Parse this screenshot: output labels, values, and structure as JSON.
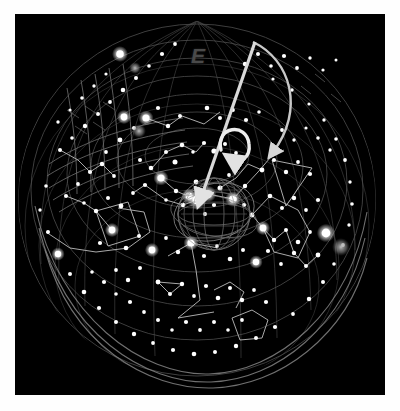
{
  "view": {
    "title": "All-sky star chart",
    "background_color": "#000000",
    "plate_border_color": "#ffffff",
    "star_color": "#ffffff",
    "constellation_line_color": "#b9b9b9",
    "grid_line_color": "#6a6a6a",
    "annotation_color": "#e8e8e8",
    "width": 400,
    "height": 411
  },
  "compass": {
    "markers": [
      {
        "label": "E",
        "x": 191,
        "y": 45,
        "color": "#4a4a4a"
      }
    ]
  },
  "annotations": {
    "pointer_arrow": {
      "name": "zenith-pointer-arrow",
      "label": "",
      "from_x": 255,
      "from_y": 45,
      "to_x": 182,
      "to_y": 187,
      "color": "#d8d8d8",
      "width": 3.2
    },
    "curved_arrow_large": {
      "name": "rotation-arrow-large",
      "label": "",
      "color": "#cfcfcf",
      "width": 2.6
    },
    "curved_arrow_small": {
      "name": "rotation-arrow-small",
      "label": "",
      "color": "#eaeaea",
      "width": 3.4
    }
  },
  "objects": {
    "center_globe": {
      "name": "wireframe-globe",
      "cx": 199,
      "cy": 200,
      "r": 36,
      "color": "#8a8a8a",
      "label": ""
    },
    "nebula_right": {
      "name": "fuzzy-object",
      "cx": 326,
      "cy": 233,
      "r": 8,
      "color": "#9a9a9a"
    },
    "nebula_upper_left": {
      "name": "fuzzy-object",
      "cx": 120,
      "cy": 54,
      "r": 5,
      "color": "#8d8d8d"
    },
    "nebula_mid_left": {
      "name": "fuzzy-object",
      "cx": 124,
      "cy": 117,
      "r": 6,
      "color": "#757575"
    }
  },
  "chart_data": {
    "type": "scatter",
    "xlabel": "",
    "ylabel": "",
    "grid": true,
    "legend_position": "none",
    "horizon_circle": {
      "cx": 197,
      "cy": 200,
      "r": 178
    },
    "altitude_circles": [
      178,
      150,
      118,
      84,
      50
    ],
    "stars": [
      [
        197,
        200,
        3.4
      ],
      [
        189,
        196,
        2.6
      ],
      [
        208,
        194,
        2.9
      ],
      [
        183,
        205,
        2.3
      ],
      [
        214,
        205,
        2.1
      ],
      [
        196,
        182,
        2.4
      ],
      [
        205,
        214,
        2.0
      ],
      [
        176,
        191,
        2.2
      ],
      [
        220,
        188,
        2.5
      ],
      [
        166,
        200,
        1.8
      ],
      [
        233,
        199,
        3.0
      ],
      [
        245,
        186,
        2.2
      ],
      [
        229,
        175,
        1.9
      ],
      [
        244,
        205,
        2.1
      ],
      [
        252,
        215,
        2.4
      ],
      [
        161,
        178,
        2.8
      ],
      [
        151,
        168,
        2.3
      ],
      [
        140,
        160,
        2.0
      ],
      [
        145,
        185,
        2.1
      ],
      [
        133,
        193,
        1.9
      ],
      [
        175,
        162,
        2.5
      ],
      [
        166,
        152,
        2.0
      ],
      [
        182,
        145,
        2.3
      ],
      [
        193,
        152,
        1.8
      ],
      [
        204,
        143,
        2.1
      ],
      [
        214,
        151,
        2.6
      ],
      [
        225,
        144,
        2.0
      ],
      [
        236,
        153,
        1.9
      ],
      [
        121,
        206,
        2.4
      ],
      [
        108,
        198,
        2.0
      ],
      [
        96,
        211,
        2.2
      ],
      [
        84,
        203,
        1.8
      ],
      [
        112,
        230,
        2.5
      ],
      [
        100,
        243,
        2.1
      ],
      [
        126,
        248,
        2.3
      ],
      [
        139,
        236,
        2.0
      ],
      [
        152,
        250,
        2.6
      ],
      [
        166,
        238,
        1.9
      ],
      [
        178,
        252,
        2.2
      ],
      [
        191,
        243,
        2.8
      ],
      [
        204,
        256,
        2.1
      ],
      [
        217,
        246,
        1.9
      ],
      [
        230,
        259,
        2.3
      ],
      [
        243,
        250,
        2.0
      ],
      [
        256,
        262,
        2.5
      ],
      [
        268,
        251,
        2.1
      ],
      [
        281,
        264,
        1.9
      ],
      [
        294,
        253,
        2.2
      ],
      [
        306,
        266,
        2.0
      ],
      [
        318,
        255,
        2.4
      ],
      [
        60,
        150,
        2.0
      ],
      [
        72,
        138,
        1.8
      ],
      [
        85,
        126,
        2.2
      ],
      [
        98,
        114,
        2.0
      ],
      [
        110,
        102,
        1.9
      ],
      [
        123,
        90,
        2.3
      ],
      [
        136,
        78,
        2.0
      ],
      [
        149,
        66,
        1.8
      ],
      [
        162,
        54,
        2.1
      ],
      [
        175,
        44,
        1.9
      ],
      [
        245,
        64,
        2.2
      ],
      [
        258,
        54,
        2.0
      ],
      [
        271,
        66,
        1.8
      ],
      [
        284,
        56,
        2.1
      ],
      [
        297,
        68,
        1.9
      ],
      [
        310,
        58,
        1.7
      ],
      [
        323,
        70,
        1.6
      ],
      [
        336,
        60,
        1.5
      ],
      [
        46,
        186,
        1.8
      ],
      [
        40,
        210,
        1.7
      ],
      [
        48,
        232,
        2.0
      ],
      [
        58,
        254,
        2.2
      ],
      [
        70,
        274,
        2.0
      ],
      [
        84,
        292,
        2.3
      ],
      [
        99,
        308,
        2.1
      ],
      [
        116,
        322,
        2.0
      ],
      [
        134,
        334,
        2.2
      ],
      [
        153,
        343,
        1.9
      ],
      [
        173,
        350,
        2.1
      ],
      [
        194,
        354,
        2.3
      ],
      [
        215,
        352,
        2.0
      ],
      [
        236,
        346,
        2.2
      ],
      [
        256,
        338,
        2.0
      ],
      [
        275,
        327,
        2.1
      ],
      [
        293,
        314,
        1.9
      ],
      [
        309,
        299,
        2.2
      ],
      [
        323,
        282,
        2.0
      ],
      [
        334,
        264,
        1.8
      ],
      [
        343,
        245,
        1.9
      ],
      [
        349,
        225,
        1.7
      ],
      [
        352,
        204,
        1.8
      ],
      [
        350,
        182,
        1.7
      ],
      [
        345,
        160,
        1.9
      ],
      [
        336,
        139,
        1.8
      ],
      [
        324,
        120,
        1.7
      ],
      [
        309,
        104,
        1.6
      ],
      [
        292,
        90,
        1.7
      ],
      [
        273,
        79,
        1.6
      ],
      [
        146,
        118,
        2.6
      ],
      [
        158,
        108,
        2.1
      ],
      [
        134,
        128,
        2.0
      ],
      [
        120,
        140,
        2.4
      ],
      [
        106,
        152,
        1.9
      ],
      [
        168,
        126,
        2.2
      ],
      [
        180,
        116,
        2.0
      ],
      [
        207,
        108,
        2.3
      ],
      [
        220,
        118,
        2.0
      ],
      [
        233,
        110,
        1.9
      ],
      [
        246,
        120,
        2.1
      ],
      [
        259,
        112,
        1.8
      ],
      [
        90,
        172,
        2.1
      ],
      [
        78,
        184,
        1.9
      ],
      [
        66,
        196,
        2.0
      ],
      [
        102,
        164,
        2.2
      ],
      [
        114,
        176,
        1.9
      ],
      [
        262,
        170,
        2.4
      ],
      [
        274,
        160,
        2.0
      ],
      [
        286,
        172,
        2.2
      ],
      [
        298,
        162,
        1.9
      ],
      [
        310,
        174,
        2.1
      ],
      [
        270,
        196,
        2.3
      ],
      [
        282,
        208,
        2.0
      ],
      [
        294,
        198,
        2.2
      ],
      [
        306,
        210,
        1.9
      ],
      [
        318,
        200,
        2.1
      ],
      [
        263,
        228,
        2.6
      ],
      [
        274,
        240,
        2.2
      ],
      [
        286,
        230,
        2.0
      ],
      [
        298,
        242,
        2.3
      ],
      [
        310,
        232,
        1.9
      ],
      [
        158,
        282,
        2.4
      ],
      [
        170,
        294,
        2.0
      ],
      [
        182,
        284,
        2.2
      ],
      [
        194,
        296,
        1.9
      ],
      [
        206,
        286,
        2.1
      ],
      [
        218,
        298,
        2.3
      ],
      [
        230,
        288,
        2.0
      ],
      [
        242,
        300,
        2.2
      ],
      [
        254,
        290,
        1.9
      ],
      [
        266,
        302,
        2.1
      ],
      [
        140,
        268,
        2.0
      ],
      [
        128,
        280,
        2.2
      ],
      [
        116,
        270,
        1.9
      ],
      [
        104,
        282,
        2.1
      ],
      [
        92,
        272,
        1.8
      ],
      [
        330,
        150,
        1.7
      ],
      [
        318,
        138,
        1.8
      ],
      [
        306,
        128,
        1.6
      ],
      [
        294,
        140,
        1.7
      ],
      [
        282,
        130,
        1.9
      ],
      [
        58,
        122,
        1.7
      ],
      [
        70,
        110,
        1.6
      ],
      [
        82,
        98,
        1.8
      ],
      [
        94,
        86,
        1.7
      ],
      [
        106,
        74,
        1.6
      ],
      [
        200,
        330,
        1.9
      ],
      [
        214,
        322,
        2.0
      ],
      [
        228,
        330,
        1.8
      ],
      [
        242,
        320,
        1.9
      ],
      [
        186,
        322,
        2.1
      ],
      [
        172,
        330,
        1.8
      ],
      [
        158,
        320,
        2.0
      ],
      [
        144,
        312,
        1.9
      ],
      [
        130,
        302,
        2.1
      ],
      [
        116,
        294,
        1.8
      ]
    ],
    "bright_stars": [
      [
        197,
        200,
        4.6
      ],
      [
        208,
        194,
        4.0
      ],
      [
        189,
        196,
        3.6
      ],
      [
        233,
        199,
        3.8
      ],
      [
        112,
        230,
        3.4
      ],
      [
        161,
        178,
        3.6
      ],
      [
        146,
        118,
        3.6
      ],
      [
        326,
        233,
        4.4
      ],
      [
        120,
        54,
        3.8
      ],
      [
        191,
        243,
        3.6
      ],
      [
        263,
        228,
        3.4
      ],
      [
        152,
        250,
        3.4
      ],
      [
        58,
        254,
        3.2
      ],
      [
        124,
        117,
        3.4
      ],
      [
        256,
        262,
        3.2
      ]
    ],
    "constellations": [
      {
        "name": "big-dipper",
        "path": [
          [
            46,
            232
          ],
          [
            70,
            248
          ],
          [
            96,
            252
          ],
          [
            128,
            248
          ],
          [
            150,
            232
          ],
          [
            144,
            212
          ],
          [
            118,
            208
          ]
        ]
      },
      {
        "name": "central-cluster",
        "path": [
          [
            161,
            178
          ],
          [
            176,
            191
          ],
          [
            197,
            200
          ],
          [
            208,
            194
          ],
          [
            233,
            199
          ],
          [
            245,
            186
          ]
        ]
      },
      {
        "name": "central-cluster-2",
        "path": [
          [
            197,
            200
          ],
          [
            183,
            205
          ],
          [
            166,
            200
          ],
          [
            145,
            185
          ],
          [
            133,
            193
          ]
        ]
      },
      {
        "name": "cassiopeia",
        "path": [
          [
            146,
            118
          ],
          [
            168,
            126
          ],
          [
            182,
            116
          ],
          [
            204,
            124
          ],
          [
            220,
            112
          ]
        ]
      },
      {
        "name": "orion-belt",
        "path": [
          [
            263,
            228
          ],
          [
            274,
            240
          ],
          [
            286,
            230
          ]
        ]
      },
      {
        "name": "orion-body",
        "path": [
          [
            252,
            215
          ],
          [
            263,
            228
          ],
          [
            274,
            252
          ],
          [
            298,
            258
          ],
          [
            310,
            232
          ],
          [
            298,
            210
          ],
          [
            270,
            196
          ],
          [
            252,
            215
          ]
        ]
      },
      {
        "name": "triangle-right",
        "path": [
          [
            272,
            160
          ],
          [
            312,
            168
          ],
          [
            286,
            206
          ],
          [
            272,
            160
          ]
        ]
      },
      {
        "name": "lyra",
        "path": [
          [
            158,
            282
          ],
          [
            170,
            294
          ],
          [
            182,
            284
          ],
          [
            158,
            282
          ]
        ]
      },
      {
        "name": "cygnus",
        "path": [
          [
            191,
            243
          ],
          [
            196,
            270
          ],
          [
            200,
            300
          ],
          [
            178,
            318
          ],
          [
            214,
            312
          ]
        ]
      },
      {
        "name": "cygnus-cross",
        "path": [
          [
            168,
            256
          ],
          [
            191,
            243
          ],
          [
            218,
            248
          ]
        ]
      },
      {
        "name": "pegasus-square",
        "path": [
          [
            96,
            211
          ],
          [
            128,
            202
          ],
          [
            140,
            236
          ],
          [
            108,
            246
          ],
          [
            96,
            211
          ]
        ]
      },
      {
        "name": "ursa-minor",
        "path": [
          [
            152,
            168
          ],
          [
            166,
            152
          ],
          [
            182,
            145
          ],
          [
            196,
            152
          ],
          [
            204,
            143
          ]
        ]
      },
      {
        "name": "draco-tail",
        "path": [
          [
            112,
            230
          ],
          [
            96,
            211
          ],
          [
            84,
            203
          ],
          [
            66,
            196
          ]
        ]
      },
      {
        "name": "bottom-pentagon",
        "path": [
          [
            232,
            318
          ],
          [
            252,
            310
          ],
          [
            268,
            320
          ],
          [
            262,
            338
          ],
          [
            240,
            340
          ],
          [
            232,
            318
          ]
        ]
      },
      {
        "name": "perseus-chain",
        "path": [
          [
            245,
            186
          ],
          [
            258,
            172
          ],
          [
            270,
            158
          ],
          [
            284,
            150
          ]
        ]
      },
      {
        "name": "auriga-chain",
        "path": [
          [
            220,
            188
          ],
          [
            236,
            178
          ],
          [
            248,
            164
          ],
          [
            262,
            170
          ]
        ]
      },
      {
        "name": "gemini-chain",
        "path": [
          [
            286,
            230
          ],
          [
            294,
            253
          ],
          [
            306,
            266
          ],
          [
            318,
            255
          ]
        ]
      },
      {
        "name": "taurus-v",
        "path": [
          [
            214,
            290
          ],
          [
            230,
            282
          ],
          [
            244,
            292
          ],
          [
            236,
            308
          ]
        ]
      },
      {
        "name": "left-arc-chain",
        "path": [
          [
            60,
            150
          ],
          [
            78,
            160
          ],
          [
            90,
            172
          ],
          [
            102,
            164
          ],
          [
            114,
            176
          ]
        ]
      }
    ],
    "grid_meridians": 12,
    "grid_parallels": 5
  }
}
